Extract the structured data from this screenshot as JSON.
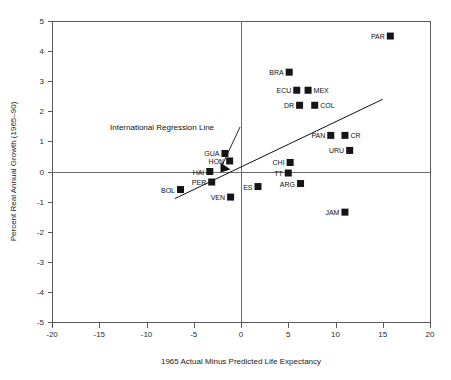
{
  "chart_data": {
    "type": "scatter",
    "title": "",
    "xlabel": "1965 Actual Minus Predicted Life Expectancy",
    "ylabel": "Percent Real Annual Growth (1965–90)",
    "xlim": [
      -20,
      20
    ],
    "ylim": [
      -5,
      5
    ],
    "xticks": [
      -20,
      -15,
      -10,
      -5,
      0,
      5,
      10,
      15,
      20
    ],
    "yticks": [
      5,
      4,
      3,
      2,
      1,
      0,
      -1,
      -2,
      -3,
      -4,
      -5
    ],
    "xtick_labels": [
      "-20",
      "-15",
      "-10",
      "-5",
      "0",
      "5",
      "10",
      "15",
      "20"
    ],
    "ytick_labels": [
      "5",
      "4",
      "3",
      "2",
      "1",
      "0",
      "-1",
      "-2",
      "-3",
      "-4",
      "-5"
    ],
    "grid": false,
    "legend": "none",
    "zero_lines": true,
    "points": [
      {
        "label": "PAR",
        "x": 15.8,
        "y": 4.5,
        "label_side": "left"
      },
      {
        "label": "BRA",
        "x": 5.1,
        "y": 3.3,
        "label_side": "left"
      },
      {
        "label": "ECU",
        "x": 5.9,
        "y": 2.7,
        "label_side": "left"
      },
      {
        "label": "MEX",
        "x": 7.1,
        "y": 2.7,
        "label_side": "right"
      },
      {
        "label": "DR",
        "x": 6.2,
        "y": 2.2,
        "label_side": "left"
      },
      {
        "label": "COL",
        "x": 7.8,
        "y": 2.2,
        "label_side": "right"
      },
      {
        "label": "PAN",
        "x": 9.5,
        "y": 1.2,
        "label_side": "left"
      },
      {
        "label": "CR",
        "x": 11.0,
        "y": 1.2,
        "label_side": "right"
      },
      {
        "label": "URU",
        "x": 11.5,
        "y": 0.7,
        "label_side": "left"
      },
      {
        "label": "CHI",
        "x": 5.2,
        "y": 0.3,
        "label_side": "left"
      },
      {
        "label": "TT",
        "x": 5.0,
        "y": -0.05,
        "label_side": "left"
      },
      {
        "label": "ARG",
        "x": 6.3,
        "y": -0.4,
        "label_side": "left"
      },
      {
        "label": "ES",
        "x": 1.8,
        "y": -0.5,
        "label_side": "left"
      },
      {
        "label": "JAM",
        "x": 11.0,
        "y": -1.35,
        "label_side": "left"
      },
      {
        "label": "GUA",
        "x": -1.7,
        "y": 0.6,
        "label_side": "left"
      },
      {
        "label": "HON",
        "x": -1.2,
        "y": 0.35,
        "label_side": "left"
      },
      {
        "label": "HAI",
        "x": -3.3,
        "y": 0.0,
        "label_side": "left"
      },
      {
        "label": "PER",
        "x": -3.1,
        "y": -0.35,
        "label_side": "left"
      },
      {
        "label": "BOL",
        "x": -6.4,
        "y": -0.6,
        "label_side": "left"
      },
      {
        "label": "VEN",
        "x": -1.1,
        "y": -0.85,
        "label_side": "left"
      }
    ],
    "regression_line": {
      "label": "International Regression Line",
      "x_start": -7.0,
      "y_start": -0.9,
      "x_end": 15.0,
      "y_end": 2.4
    },
    "annotation": {
      "text": "International Regression Line",
      "arrow_target_x": -0.9,
      "arrow_target_y": 0.0
    }
  }
}
